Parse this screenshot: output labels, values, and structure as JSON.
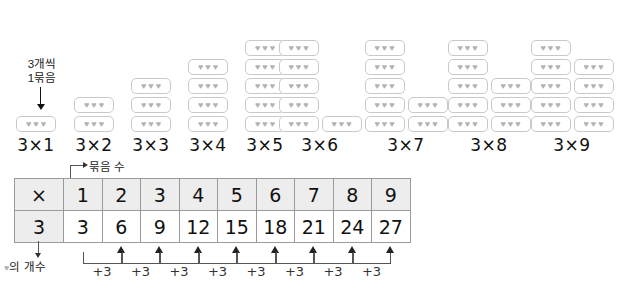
{
  "diagram": {
    "bundle_note_line1": "3개씩",
    "bundle_note_line2": "1묶음",
    "heart_glyph": "♥",
    "hearts_per_bundle": 3,
    "max_stack_height": 5,
    "groups": [
      {
        "label": "3×1",
        "bundles": 1,
        "left": 8,
        "width": 56
      },
      {
        "label": "3×2",
        "bundles": 2,
        "left": 66,
        "width": 56
      },
      {
        "label": "3×3",
        "bundles": 3,
        "left": 123,
        "width": 56
      },
      {
        "label": "3×4",
        "bundles": 4,
        "left": 180,
        "width": 56
      },
      {
        "label": "3×5",
        "bundles": 5,
        "left": 237,
        "width": 56
      },
      {
        "label": "3×6",
        "bundles": 6,
        "left": 274,
        "width": 92
      },
      {
        "label": "3×7",
        "bundles": 7,
        "left": 360,
        "width": 92
      },
      {
        "label": "3×8",
        "bundles": 8,
        "left": 443,
        "width": 92
      },
      {
        "label": "3×9",
        "bundles": 9,
        "left": 526,
        "width": 92
      }
    ]
  },
  "table": {
    "bundle_count_label": "묶음 수",
    "heart_count_label_prefix": "♥",
    "heart_count_label": "의 개수",
    "corner_symbol": "×",
    "row_head": "3",
    "columns": [
      "1",
      "2",
      "3",
      "4",
      "5",
      "6",
      "7",
      "8",
      "9"
    ],
    "products": [
      "3",
      "6",
      "9",
      "12",
      "15",
      "18",
      "21",
      "24",
      "27"
    ],
    "step_label": "+3",
    "step_count": 8
  },
  "colors": {
    "heart": "#b3b3b3",
    "bundle_border": "#c9c9c9",
    "table_border": "#9a9a9a",
    "table_header_fill": "#ededed",
    "text": "#111111",
    "arrow": "#333333"
  }
}
